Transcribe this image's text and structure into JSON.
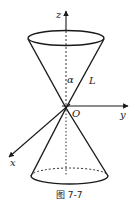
{
  "figure": {
    "caption": "图 7-7",
    "labels": {
      "z_axis": "z",
      "y_axis": "y",
      "x_axis": "x",
      "origin": "O",
      "angle": "α",
      "generatrix": "L"
    },
    "colors": {
      "stroke": "#1a1a1a",
      "background": "#ffffff"
    }
  }
}
